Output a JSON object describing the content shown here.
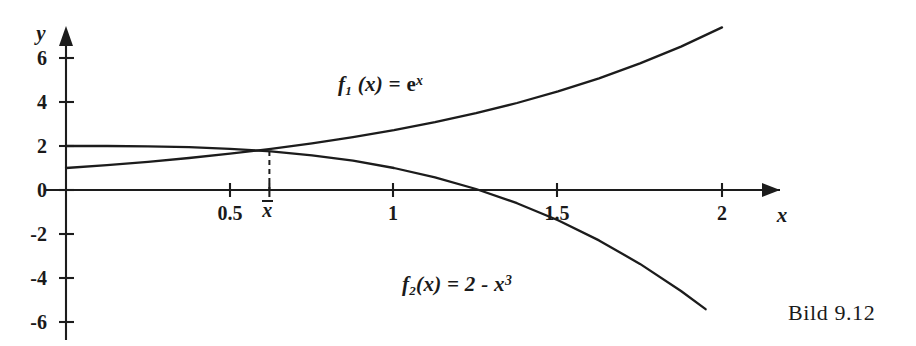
{
  "figure": {
    "caption": "Bild 9.12",
    "x_axis_name": "x",
    "y_axis_name": "y"
  },
  "labels": {
    "f1_f": "f",
    "f1_sub": "1",
    "f1_arg": " (x) =  ",
    "f1_e": "e",
    "f1_exp": "x",
    "f2_f": "f",
    "f2_sub": "2",
    "f2_rest": "(x) = 2 - ",
    "f2_x": "x",
    "f2_exp": "3",
    "xbar": "x"
  },
  "chart_data": {
    "type": "line",
    "title": "Bild 9.12",
    "xlabel": "x",
    "ylabel": "y",
    "xlim": [
      -0.1,
      2.25
    ],
    "ylim": [
      -6.8,
      7.6
    ],
    "grid": false,
    "legend": "inline-annotations",
    "x_ticks": [
      0.5,
      1,
      1.5,
      2
    ],
    "x_tick_labels": [
      "0.5",
      "1",
      "1.5",
      "2"
    ],
    "y_ticks": [
      -6,
      -4,
      -2,
      0,
      2,
      4,
      6
    ],
    "y_tick_labels": [
      "-6",
      "-4",
      "-2",
      "0",
      "2",
      "4",
      "6"
    ],
    "special_ticks": [
      {
        "label": "x̄",
        "x": 0.62,
        "annotation": "intersection abscissa, drawn with dashed drop line"
      }
    ],
    "series": [
      {
        "name": "f1(x) = e^x",
        "annotation": "f₁ (x) =  eˣ",
        "x": [
          0,
          0.125,
          0.25,
          0.375,
          0.5,
          0.625,
          0.75,
          0.875,
          1,
          1.125,
          1.25,
          1.375,
          1.5,
          1.625,
          1.75,
          1.875,
          2
        ],
        "y": [
          1,
          1.133,
          1.284,
          1.455,
          1.649,
          1.868,
          2.117,
          2.399,
          2.718,
          3.08,
          3.49,
          3.955,
          4.482,
          5.078,
          5.755,
          6.52,
          7.389
        ]
      },
      {
        "name": "f2(x) = 2 - x^3",
        "annotation": "f₂(x) = 2 - x³",
        "x": [
          0,
          0.125,
          0.25,
          0.375,
          0.5,
          0.625,
          0.75,
          0.875,
          1,
          1.125,
          1.25,
          1.375,
          1.5,
          1.625,
          1.75,
          1.875,
          1.95
        ],
        "y": [
          2,
          1.998,
          1.984,
          1.947,
          1.875,
          1.756,
          1.578,
          1.33,
          1,
          0.576,
          0.047,
          -0.6,
          -1.375,
          -2.291,
          -3.359,
          -4.592,
          -5.42
        ]
      }
    ],
    "intersection": {
      "x": 0.62,
      "y": 1.86
    },
    "root_of_f2": 1.26
  }
}
